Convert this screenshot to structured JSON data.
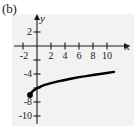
{
  "figure": {
    "part_label": "(b)",
    "x_axis_name": "x",
    "y_axis_name": "y"
  },
  "chart_data": {
    "type": "line",
    "title": "",
    "subtitle": "",
    "xlabel": "x",
    "ylabel": "y",
    "xlim": [
      -3,
      12
    ],
    "ylim": [
      -11,
      3
    ],
    "xticks": [
      -2,
      2,
      4,
      6,
      8,
      10
    ],
    "xtick_labels": [
      "-2",
      "2",
      "4",
      "6",
      "8",
      "10"
    ],
    "yticks": [
      2,
      -4,
      -8,
      -10
    ],
    "ytick_labels": [
      "2",
      "-4",
      "-8",
      "-10"
    ],
    "grid": false,
    "legend": "none",
    "annotations": [
      "(b)"
    ],
    "series": [
      {
        "name": "curve",
        "style": "solid",
        "color": "#000000",
        "endpoint_marker": "filled-circle",
        "endpoint": [
          -1,
          -7
        ],
        "x": [
          -1,
          -0.8,
          -0.5,
          0,
          0.5,
          1,
          2,
          3,
          4,
          5,
          6,
          7,
          8,
          9,
          10,
          11
        ],
        "y": [
          -7,
          -6.65,
          -6.35,
          -6.05,
          -5.8,
          -5.6,
          -5.3,
          -5.05,
          -4.85,
          -4.65,
          -4.45,
          -4.3,
          -4.15,
          -4.0,
          -3.85,
          -3.7
        ]
      }
    ]
  }
}
